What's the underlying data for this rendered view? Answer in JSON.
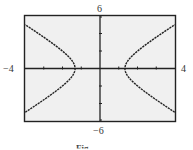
{
  "chart_data": {
    "type": "line",
    "title": "",
    "xlabel": "",
    "ylabel": "",
    "xlim": [
      -4,
      4
    ],
    "ylim": [
      -6,
      6
    ],
    "window_labels": {
      "xmin": "−4",
      "xmax": "4",
      "ymin": "−6",
      "ymax": "6"
    },
    "x_ticks": [
      -3,
      -2,
      -1,
      1,
      2,
      3
    ],
    "y_ticks": [
      -4,
      -2,
      2,
      4
    ],
    "grid": false,
    "legend": null,
    "series": [
      {
        "name": "hyperbola (horizontal transverse axis)",
        "description": "x^2/a^2 - y^2/b^2 = 1, vertices at (±1.33, 0)",
        "a": 1.33,
        "b": 1.77,
        "vertices": [
          [
            -1.33,
            0
          ],
          [
            1.33,
            0
          ]
        ],
        "endpoints": [
          [
            -4,
            5
          ],
          [
            -4,
            -5
          ],
          [
            4,
            5
          ],
          [
            4,
            -5
          ]
        ]
      }
    ],
    "plot_background": "#f0f0f0",
    "line_color": "#222222"
  },
  "caption": "Fig..."
}
